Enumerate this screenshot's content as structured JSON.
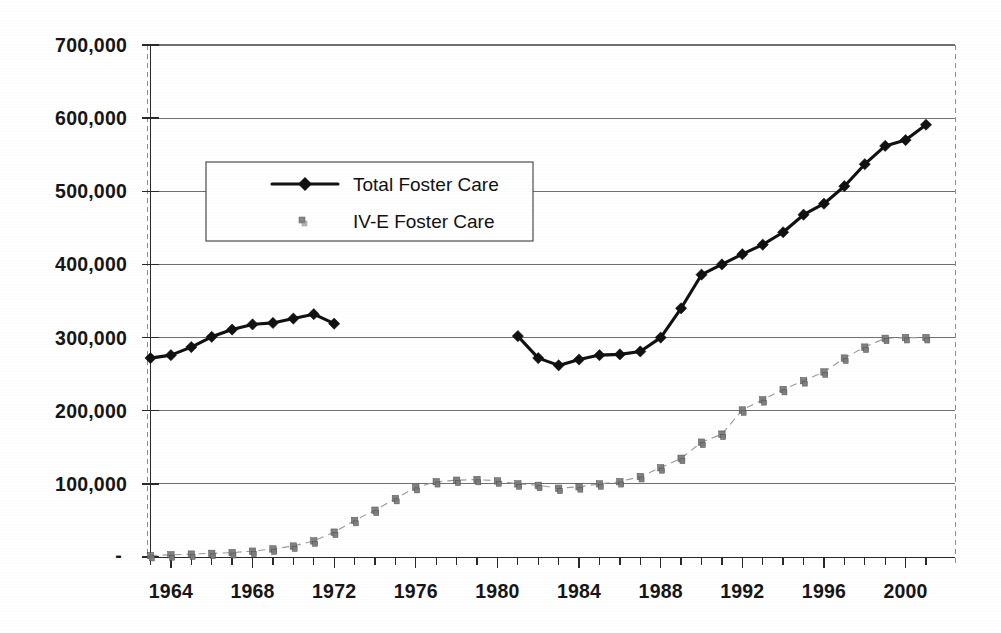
{
  "chart_data": {
    "type": "line",
    "title": "",
    "subtitle": "",
    "xlabel": "",
    "ylabel": "",
    "grid": true,
    "legend_position": "upper-left-inside",
    "xlim": [
      1963,
      2001
    ],
    "ylim": [
      0,
      700000
    ],
    "y_ticks": [
      "-",
      "100,000",
      "200,000",
      "300,000",
      "400,000",
      "500,000",
      "600,000",
      "700,000"
    ],
    "y_tick_values": [
      0,
      100000,
      200000,
      300000,
      400000,
      500000,
      600000,
      700000
    ],
    "x_ticks": [
      "1964",
      "1968",
      "1972",
      "1976",
      "1980",
      "1984",
      "1988",
      "1992",
      "1996",
      "2000"
    ],
    "x_tick_values": [
      1964,
      1968,
      1972,
      1976,
      1980,
      1984,
      1988,
      1992,
      1996,
      2000
    ],
    "x_minor_tick_step": 1,
    "series": [
      {
        "name": "Total Foster Care",
        "marker": "diamond",
        "color": "#111111",
        "style": "line-with-markers",
        "x": [
          1963,
          1964,
          1965,
          1966,
          1967,
          1968,
          1969,
          1970,
          1971,
          1972,
          1981,
          1982,
          1983,
          1984,
          1985,
          1986,
          1987,
          1988,
          1989,
          1990,
          1991,
          1992,
          1993,
          1994,
          1995,
          1996,
          1997,
          1998,
          1999,
          2000,
          2001
        ],
        "values": [
          272000,
          276000,
          287000,
          301000,
          311000,
          318000,
          320000,
          326000,
          332000,
          319000,
          302000,
          272000,
          262000,
          270000,
          276000,
          277000,
          281000,
          300000,
          340000,
          386000,
          400000,
          414000,
          427000,
          444000,
          468000,
          483000,
          507000,
          537000,
          562000,
          570000,
          591000
        ],
        "segments": [
          {
            "from": 1963,
            "to": 1972
          },
          {
            "from": 1981,
            "to": 2001
          }
        ],
        "gap_note": "no data plotted 1973-1980"
      },
      {
        "name": "IV-E Foster Care",
        "marker": "small-square",
        "color": "#7c7c7c",
        "style": "markers-faint-dashed",
        "x": [
          1963,
          1964,
          1965,
          1966,
          1967,
          1968,
          1969,
          1970,
          1971,
          1972,
          1973,
          1974,
          1975,
          1976,
          1977,
          1978,
          1979,
          1980,
          1981,
          1982,
          1983,
          1984,
          1985,
          1986,
          1987,
          1988,
          1989,
          1990,
          1991,
          1992,
          1993,
          1994,
          1995,
          1996,
          1997,
          1998,
          1999,
          2000,
          2001
        ],
        "values": [
          2000,
          3000,
          4000,
          5000,
          6000,
          8000,
          11000,
          15000,
          22000,
          34000,
          50000,
          64000,
          80000,
          95000,
          103000,
          105000,
          106000,
          104000,
          100000,
          98000,
          94000,
          96000,
          100000,
          103000,
          110000,
          122000,
          135000,
          157000,
          168000,
          201000,
          215000,
          229000,
          241000,
          253000,
          272000,
          287000,
          299000,
          300000,
          300000
        ]
      }
    ]
  },
  "legend": {
    "items": [
      {
        "label": "Total Foster Care",
        "marker": "diamond-line"
      },
      {
        "label": "IV-E Foster Care",
        "marker": "small-square"
      }
    ]
  }
}
